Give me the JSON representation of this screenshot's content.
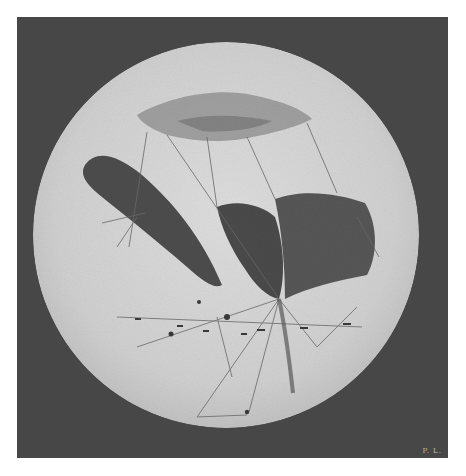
{
  "figure": {
    "signature": "P. L.",
    "colors": {
      "background": "#ffffff",
      "frame": "#474747",
      "disc": "#d2d2d2",
      "markings": "#4a4a4a",
      "lines": "#6a6a6a"
    },
    "disc": {
      "cx": 209,
      "cy": 218,
      "r": 193
    }
  }
}
